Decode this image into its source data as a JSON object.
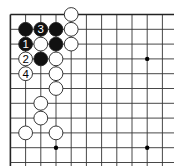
{
  "diagram": {
    "type": "go-board-fragment",
    "grid": {
      "origin_x": 10.4,
      "origin_y": 14.5,
      "spacing_x": 15.2,
      "spacing_y": 14.8,
      "cols": 11,
      "rows": 11,
      "top_edge": true,
      "left_edge": true,
      "line_extend_right": 174,
      "line_extend_bottom": 166
    },
    "star_points": [
      {
        "col": 3,
        "row": 9
      },
      {
        "col": 9,
        "row": 3
      },
      {
        "col": 9,
        "row": 9
      }
    ],
    "stones": [
      {
        "color": "white",
        "col": 4,
        "row": 0,
        "label": ""
      },
      {
        "color": "black",
        "col": 1,
        "row": 1,
        "label": ""
      },
      {
        "color": "black",
        "col": 2,
        "row": 1,
        "label": "3"
      },
      {
        "color": "black",
        "col": 3,
        "row": 1,
        "label": ""
      },
      {
        "color": "white",
        "col": 4,
        "row": 1,
        "label": ""
      },
      {
        "color": "black",
        "col": 1,
        "row": 2,
        "label": "1"
      },
      {
        "color": "white",
        "col": 2,
        "row": 2,
        "label": ""
      },
      {
        "color": "black",
        "col": 3,
        "row": 2,
        "label": ""
      },
      {
        "color": "white",
        "col": 4,
        "row": 2,
        "label": ""
      },
      {
        "color": "white",
        "col": 1,
        "row": 3,
        "label": "2"
      },
      {
        "color": "black",
        "col": 2,
        "row": 3,
        "label": ""
      },
      {
        "color": "white",
        "col": 3,
        "row": 3,
        "label": ""
      },
      {
        "color": "white",
        "col": 1,
        "row": 4,
        "label": "4"
      },
      {
        "color": "white",
        "col": 3,
        "row": 4,
        "label": ""
      },
      {
        "color": "white",
        "col": 3,
        "row": 5,
        "label": ""
      },
      {
        "color": "white",
        "col": 2,
        "row": 6,
        "label": ""
      },
      {
        "color": "white",
        "col": 2,
        "row": 7,
        "label": ""
      },
      {
        "color": "white",
        "col": 1,
        "row": 8,
        "label": ""
      },
      {
        "color": "white",
        "col": 3,
        "row": 8,
        "label": ""
      }
    ],
    "colors": {
      "line": "#333333",
      "edge": "#222222",
      "black_stone": "#111111",
      "white_stone": "#ffffff",
      "stone_outline": "#222222"
    }
  }
}
